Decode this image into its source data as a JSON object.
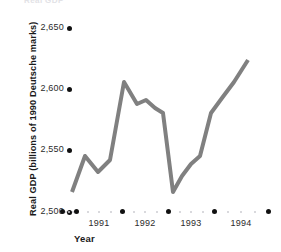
{
  "chart_data": {
    "type": "line",
    "title": "Real GDP",
    "xlabel": "Year",
    "ylabel": "Real GDP (billions of 1990 Deutsche marks)",
    "ylim": [
      2500,
      2650
    ],
    "y_ticks": [
      2500,
      2550,
      2600,
      2650
    ],
    "y_tick_labels": [
      "2,500",
      "2,550",
      "2,600",
      "2,650"
    ],
    "x_major_ticks": [
      "1990",
      "1991",
      "1992",
      "1993",
      "1994",
      "1995"
    ],
    "x_tick_labels": [
      "1991",
      "1992",
      "1993",
      "1994"
    ],
    "x_minor_per_interval": 3,
    "grid": false,
    "legend": "none",
    "line_color": "#808080",
    "line_width": 4,
    "x": [
      "1990 Q3",
      "1990 Q4",
      "1991 Q1",
      "1991 Q2",
      "1991 Q3",
      "1991 Q4",
      "1992 Q1",
      "1992 Q2",
      "1992 Q3",
      "1992 Q4",
      "1993 Q1",
      "1993 Q2",
      "1993 Q3",
      "1993 Q4",
      "1994 Q1",
      "1994 Q2",
      "1994 Q3"
    ],
    "values": [
      2518,
      2544,
      2527,
      2540,
      2603,
      2586,
      2590,
      2582,
      2578,
      2530,
      2545,
      2556,
      2562,
      2591,
      2604,
      2618,
      2629
    ]
  },
  "axes": {
    "clipped_title": "Real GDP",
    "y_title": "Real GDP (billions of 1990 Deutsche marks)",
    "x_title": "Year"
  },
  "geometry": {
    "y_pixels": {
      "2650": 28,
      "2600": 89,
      "2550": 150,
      "2500": 212
    },
    "x_major_pixels": [
      62,
      76,
      122,
      168,
      214,
      268
    ],
    "series_points": [
      [
        72,
        192
      ],
      [
        85,
        156
      ],
      [
        98,
        172
      ],
      [
        110,
        160
      ],
      [
        124,
        82
      ],
      [
        137,
        104
      ],
      [
        146,
        100
      ],
      [
        155,
        108
      ],
      [
        163,
        113
      ],
      [
        173,
        192
      ],
      [
        182,
        176
      ],
      [
        191,
        164
      ],
      [
        200,
        156
      ],
      [
        211,
        113
      ],
      [
        222,
        98
      ],
      [
        234,
        82
      ],
      [
        248,
        60
      ]
    ]
  }
}
